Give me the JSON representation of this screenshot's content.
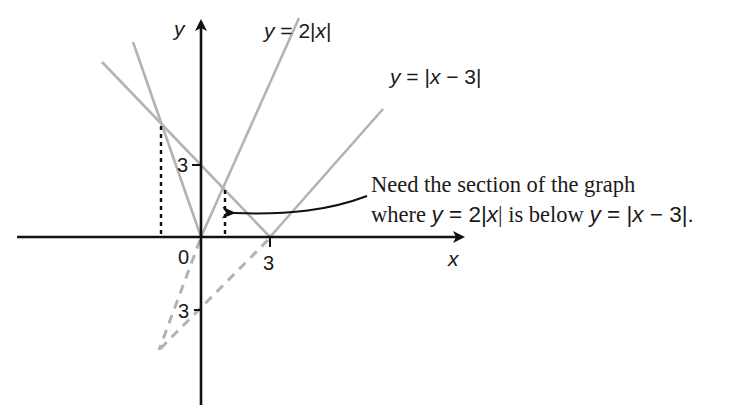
{
  "diagram": {
    "axes": {
      "x_label": "x",
      "y_label": "y",
      "origin_label": "0",
      "x_tick_label": "3",
      "y_tick_pos_label": "3",
      "y_tick_neg_label": "3"
    },
    "curves": [
      {
        "name": "y = 2|x|",
        "label_parts": [
          "y",
          " = 2|",
          "x",
          "|"
        ],
        "color": "#b0b0b0"
      },
      {
        "name": "y = |x − 3|",
        "label_parts": [
          "y",
          " = |",
          "x",
          " − 3|"
        ],
        "color": "#b0b0b0"
      }
    ],
    "annotation": {
      "line1": "Need the section of the graph",
      "line2_parts": [
        "where ",
        "y",
        " = 2|",
        "x",
        "| is below ",
        "y",
        " = |",
        "x",
        " − 3|."
      ]
    },
    "colors": {
      "axis": "#111111",
      "curve": "#b0b0b0",
      "dashed_extension": "#b0b0b0",
      "dotted_guides": "#111111",
      "text": "#1a1a1a"
    }
  }
}
